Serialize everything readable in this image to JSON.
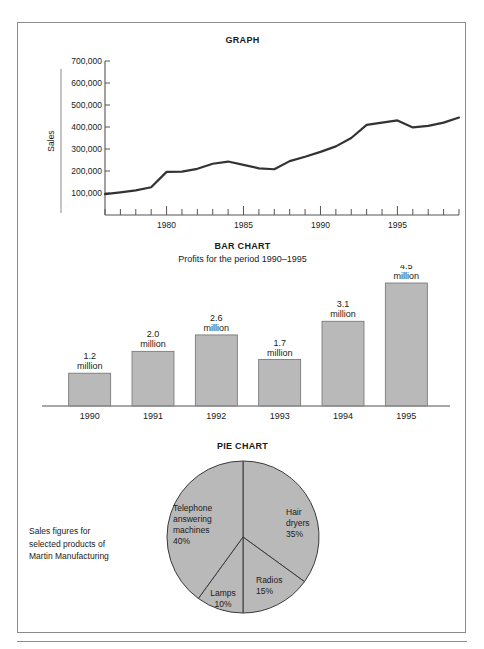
{
  "page": {
    "border_color": "#8a8a8a",
    "ink_color": "#1a1a1a",
    "fill_gray": "#b9b9b9",
    "outline_gray": "#707070"
  },
  "graph": {
    "title": "GRAPH",
    "ylabel": "Sales",
    "chart_data": {
      "type": "line",
      "title": "GRAPH",
      "xlabel": "",
      "ylabel": "Sales",
      "ylim": [
        0,
        700000
      ],
      "yticks": [
        100000,
        200000,
        300000,
        400000,
        500000,
        600000,
        700000
      ],
      "ytick_labels": [
        "100,000",
        "200,000",
        "300,000",
        "400,000",
        "500,000",
        "600,000",
        "700,000"
      ],
      "xlim": [
        1976,
        1999
      ],
      "xticks": [
        1980,
        1985,
        1990,
        1995
      ],
      "xtick_labels": [
        "1980",
        "1985",
        "1990",
        "1995"
      ],
      "grid": false,
      "legend": "none",
      "x": [
        1976,
        1977,
        1978,
        1979,
        1980,
        1981,
        1982,
        1983,
        1984,
        1985,
        1986,
        1987,
        1988,
        1989,
        1990,
        1991,
        1992,
        1993,
        1994,
        1995,
        1996,
        1997,
        1998,
        1999
      ],
      "values": [
        95000,
        103000,
        112000,
        126000,
        196000,
        197000,
        210000,
        233000,
        243000,
        228000,
        212000,
        208000,
        245000,
        265000,
        287000,
        312000,
        350000,
        410000,
        420000,
        430000,
        398000,
        405000,
        420000,
        443000
      ]
    }
  },
  "bar": {
    "title": "BAR CHART",
    "subtitle": "Profits for the period 1990–1995",
    "chart_data": {
      "type": "bar",
      "title": "BAR CHART",
      "subtitle": "Profits for the period 1990–1995",
      "xlabel": "",
      "ylabel": "",
      "unit": "million",
      "ylim": [
        0,
        4.5
      ],
      "grid": false,
      "legend": "none",
      "categories": [
        "1990",
        "1991",
        "1992",
        "1993",
        "1994",
        "1995"
      ],
      "values": [
        1.2,
        2.0,
        2.6,
        1.7,
        3.1,
        4.5
      ],
      "value_labels": [
        "1.2",
        "2.0",
        "2.6",
        "1.7",
        "3.1",
        "4.5"
      ],
      "value_label_unit": [
        "million",
        "million",
        "million",
        "million",
        "million",
        "million"
      ]
    }
  },
  "pie": {
    "title": "PIE CHART",
    "caption_lines": [
      "Sales figures for",
      "selected products of",
      "Martin Manufacturing"
    ],
    "chart_data": {
      "type": "pie",
      "title": "PIE CHART",
      "legend": "none",
      "start_angle_deg": 0,
      "direction": "clockwise",
      "labels": [
        "Hair dryers",
        "Radios",
        "Lamps",
        "Telephone answering machines"
      ],
      "values": [
        35,
        15,
        10,
        40
      ],
      "value_labels": [
        "35%",
        "15%",
        "10%",
        "40%"
      ],
      "slices": [
        {
          "label_lines": [
            "Hair",
            "dryers"
          ],
          "percent_label": "35%",
          "value": 35
        },
        {
          "label_lines": [
            "Radios"
          ],
          "percent_label": "15%",
          "value": 15
        },
        {
          "label_lines": [
            "Lamps"
          ],
          "percent_label": "10%",
          "value": 10
        },
        {
          "label_lines": [
            "Telephone",
            "answering",
            "machines"
          ],
          "percent_label": "40%",
          "value": 40
        }
      ]
    }
  }
}
